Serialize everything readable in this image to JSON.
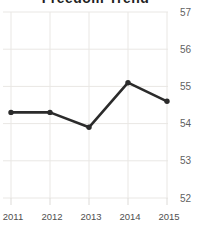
{
  "chart_data": {
    "type": "line",
    "title": "Freedom Trend",
    "categories": [
      "2011",
      "2012",
      "2013",
      "2014",
      "2015"
    ],
    "values": [
      54.3,
      54.3,
      53.9,
      55.1,
      54.6
    ],
    "xlabel": "",
    "ylabel": "",
    "ylim": [
      52,
      57
    ],
    "y_ticks": [
      57,
      56,
      55,
      54,
      53,
      52
    ],
    "grid": "on",
    "legend": "none"
  },
  "colors": {
    "line": "#2b2b2b",
    "point": "#2b2b2b",
    "grid": "#e9e7e4",
    "tick": "#dddbd8",
    "y_label": "#5f5f5f",
    "x_label": "#4f4f4f",
    "title": "#1f1f1f",
    "background": "#ffffff"
  }
}
